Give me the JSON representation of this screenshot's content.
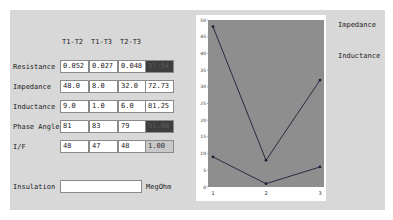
{
  "table": {
    "columns": [
      "T1-T2",
      "T1-T3",
      "T2-T3"
    ],
    "rows": [
      {
        "label": "Resistance",
        "values": [
          "0.052",
          "0.027",
          "0.048"
        ],
        "extra": "37.54",
        "extra_style": "dark"
      },
      {
        "label": "Impedance",
        "values": [
          "48.0",
          "8.0",
          "32.0"
        ],
        "extra": "72.73",
        "extra_style": "white"
      },
      {
        "label": "Inductance",
        "values": [
          "9.0",
          "1.0",
          "6.0"
        ],
        "extra": "81.25",
        "extra_style": "white"
      },
      {
        "label": "Phase Angle",
        "values": [
          "81",
          "83",
          "79"
        ],
        "extra": "91.00",
        "extra_style": "dark"
      },
      {
        "label": "I/F",
        "values": [
          "48",
          "47",
          "48"
        ],
        "extra": "1.00",
        "extra_style": "grey"
      }
    ],
    "insulation": {
      "label": "Insulation",
      "value": "",
      "unit": "MegOhm"
    }
  },
  "legend": {
    "impedance": "Impedance",
    "inductance": "Inductance"
  },
  "chart_data": {
    "type": "line",
    "x": [
      1,
      2,
      3
    ],
    "series": [
      {
        "name": "Impedance",
        "values": [
          48,
          8,
          32
        ]
      },
      {
        "name": "Inductance",
        "values": [
          9,
          1,
          6
        ]
      }
    ],
    "title": "",
    "xlabel": "",
    "ylabel": "",
    "ylim": [
      0,
      50
    ],
    "yticks": [
      0,
      5,
      10,
      15,
      20,
      25,
      30,
      35,
      40,
      45,
      50
    ],
    "xticks": [
      "1",
      "2",
      "3"
    ],
    "grid": false,
    "legend_position": "right",
    "colors": {
      "plot_bg": "#8e8e8e",
      "line": "#1e1e3a",
      "panel_bg": "#d8d8d8"
    }
  }
}
